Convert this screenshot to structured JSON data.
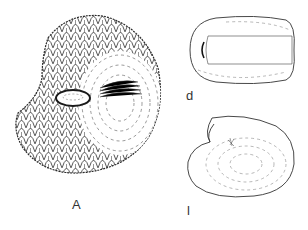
{
  "figure": {
    "panels": [
      {
        "id": "A",
        "label": "A",
        "description": "ornamented ostracod valve, lateral view with spinose/scaly surface and central muscle scar"
      },
      {
        "id": "d",
        "label": "d",
        "description": "smooth carapace, dorsal view"
      },
      {
        "id": "l",
        "label": "l",
        "description": "smooth carapace, lateral view"
      }
    ],
    "caption_truncated": "…"
  },
  "colors": {
    "line": "#2a2a2a",
    "background": "#ffffff"
  }
}
